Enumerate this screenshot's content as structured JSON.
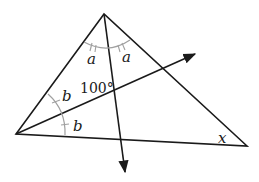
{
  "diagram": {
    "type": "geometry-triangle",
    "vertices": {
      "top": [
        104,
        14
      ],
      "left": [
        16,
        134
      ],
      "right": [
        247,
        146
      ]
    },
    "rays": [
      {
        "name": "bisector-from-top",
        "from": [
          104,
          14
        ],
        "to": [
          125,
          174
        ],
        "arrow": true
      },
      {
        "name": "bisector-from-left",
        "from": [
          16,
          134
        ],
        "to": [
          197,
          53
        ],
        "arrow": true
      }
    ],
    "intersection": [
      115,
      90
    ],
    "labels": {
      "top_angle_left": "a",
      "top_angle_right": "a",
      "left_angle_upper": "b",
      "left_angle_lower": "b",
      "intersection_angle": "100°",
      "right_angle": "x"
    },
    "colors": {
      "lines": "#1a1a1a",
      "arcs": "#a0a0a0"
    }
  }
}
